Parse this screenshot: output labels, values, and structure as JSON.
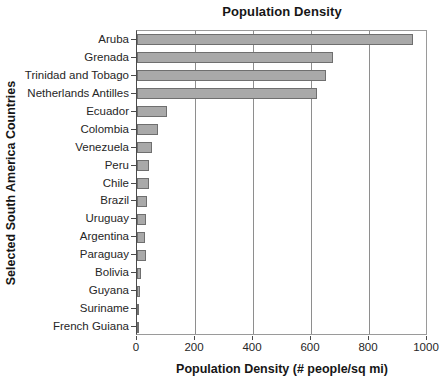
{
  "chart_data": {
    "type": "bar",
    "orientation": "horizontal",
    "title": "Population Density",
    "xlabel": "Population Density (# people/sq mi)",
    "ylabel": "Selected South America Countries",
    "categories": [
      "Aruba",
      "Grenada",
      "Trinidad and Tobago",
      "Netherlands Antilles",
      "Ecuador",
      "Colombia",
      "Venezuela",
      "Peru",
      "Chile",
      "Brazil",
      "Uruguay",
      "Argentina",
      "Paraguay",
      "Bolivia",
      "Guyana",
      "Suriname",
      "French Guiana"
    ],
    "values": [
      950,
      675,
      650,
      620,
      103,
      74,
      50,
      41,
      42,
      34,
      32,
      27,
      30,
      15,
      9,
      8,
      5
    ],
    "xlim": [
      0,
      1000
    ],
    "xticks": [
      0,
      200,
      400,
      600,
      800,
      1000
    ],
    "xtick_labels": [
      "0",
      "200",
      "400",
      "600",
      "800",
      "1000"
    ],
    "grid": "vertical",
    "legend": null,
    "bar_fill_color": "#a9a9a9",
    "bar_edge_color": "#6f6f6f",
    "axis_color": "#4a4a4a",
    "grid_color": "#8e8e8e",
    "background_color": "#ffffff"
  }
}
